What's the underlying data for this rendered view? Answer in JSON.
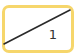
{
  "icon": {
    "name": "fraction-slash-icon",
    "denominator_label": "1",
    "colors": {
      "border": "#F6D66B",
      "fill": "#FFFFFF",
      "line": "#2A2A2A",
      "text": "#333333"
    }
  }
}
